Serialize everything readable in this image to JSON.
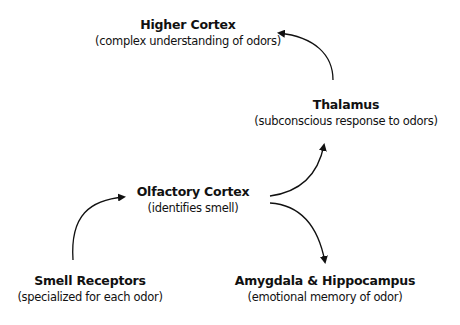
{
  "diagram": {
    "nodes": [
      {
        "id": "higher-cortex",
        "title": "Higher Cortex",
        "desc": "(complex understanding of odors)"
      },
      {
        "id": "thalamus",
        "title": "Thalamus",
        "desc": "(subconscious response to odors)"
      },
      {
        "id": "olfactory-cortex",
        "title": "Olfactory Cortex",
        "desc": "(identifies smell)"
      },
      {
        "id": "smell-receptors",
        "title": "Smell Receptors",
        "desc": "(specialized for each odor)"
      },
      {
        "id": "amygdala-hippocampus",
        "title": "Amygdala & Hippocampus",
        "desc": "(emotional memory of odor)"
      }
    ],
    "edges": [
      {
        "from": "smell-receptors",
        "to": "olfactory-cortex"
      },
      {
        "from": "olfactory-cortex",
        "to": "thalamus"
      },
      {
        "from": "olfactory-cortex",
        "to": "amygdala-hippocampus"
      },
      {
        "from": "thalamus",
        "to": "higher-cortex"
      }
    ],
    "colors": {
      "line": "#111111",
      "background": "#ffffff"
    }
  }
}
